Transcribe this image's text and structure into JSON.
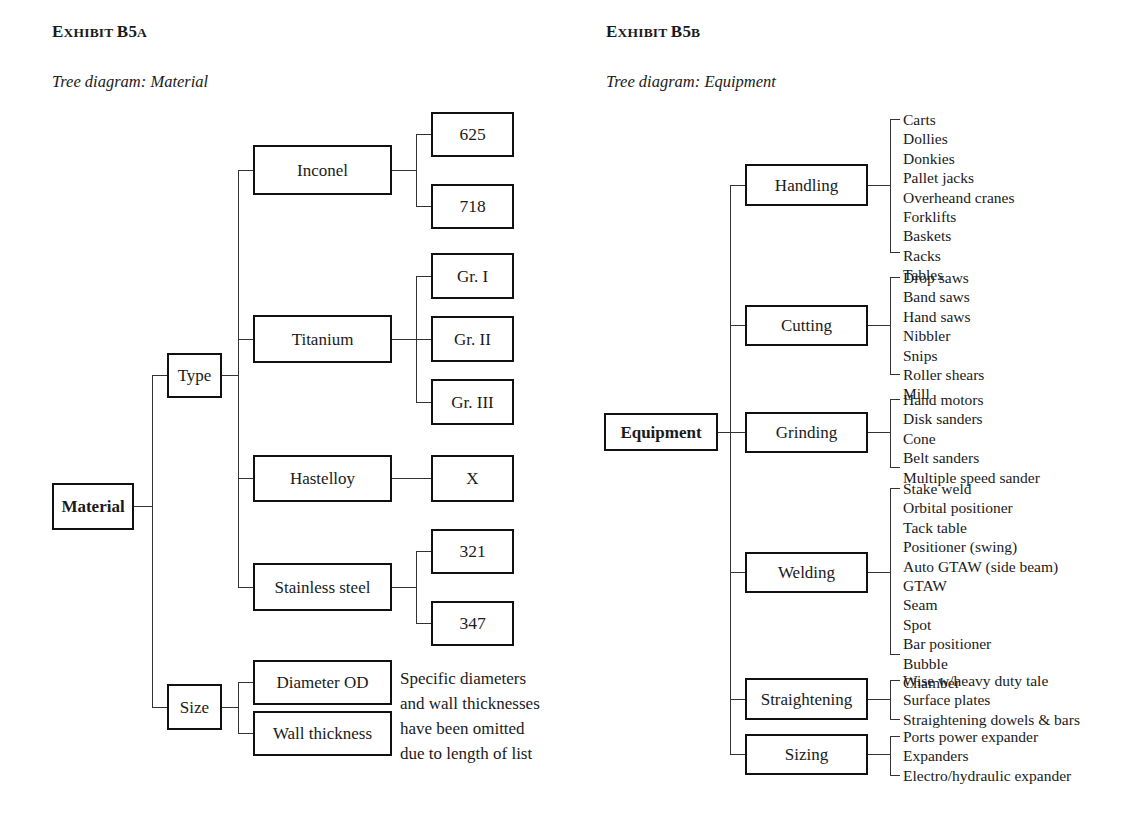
{
  "exhibits": {
    "left": {
      "label_main": "E",
      "title_rest": "XHIBIT",
      "title_full_lead": "E",
      "title": "XHIBIT ",
      "number_big": "B5",
      "number_small": "A",
      "subtitle": "Tree diagram: Material",
      "root": "Material",
      "branches": {
        "type": "Type",
        "size": "Size"
      },
      "type_children": [
        {
          "label": "Inconel",
          "grades": [
            "625",
            "718"
          ]
        },
        {
          "label": "Titanium",
          "grades": [
            "Gr. I",
            "Gr. II",
            "Gr. III"
          ]
        },
        {
          "label": "Hastelloy",
          "grades": [
            "X"
          ]
        },
        {
          "label": "Stainless steel",
          "grades": [
            "321",
            "347"
          ]
        }
      ],
      "size_children": [
        "Diameter OD",
        "Wall thickness"
      ],
      "note": "Specific diameters\nand wall thicknesses\nhave been omitted\ndue to length of list"
    },
    "right": {
      "title": "XHIBIT ",
      "number_big": "B5",
      "number_small": "B",
      "subtitle": "Tree diagram: Equipment",
      "root": "Equipment",
      "categories": [
        {
          "label": "Handling",
          "items": [
            "Carts",
            "Dollies",
            "Donkies",
            "Pallet jacks",
            "Overheand cranes",
            "Forklifts",
            "Baskets",
            "Racks",
            "Tables"
          ]
        },
        {
          "label": "Cutting",
          "items": [
            "Drop saws",
            "Band saws",
            "Hand saws",
            "Nibbler",
            "Snips",
            "Roller shears",
            "Mill"
          ]
        },
        {
          "label": "Grinding",
          "items": [
            "Hand motors",
            "Disk sanders",
            "Cone",
            "Belt sanders",
            "Multiple speed sander"
          ]
        },
        {
          "label": "Welding",
          "items": [
            "Stake weld",
            "Orbital positioner",
            "Tack table",
            "Positioner (swing)",
            "Auto GTAW (side beam)",
            "GTAW",
            "Seam",
            "Spot",
            "Bar positioner",
            "Bubble",
            "Chamber"
          ]
        },
        {
          "label": "Straightening",
          "items": [
            "Wise w/heavy duty tale",
            "Surface plates",
            "Straightening dowels & bars"
          ]
        },
        {
          "label": "Sizing",
          "items": [
            "Ports power expander",
            "Expanders",
            "Electro/hydraulic expander"
          ]
        }
      ]
    }
  },
  "colors": {
    "ink": "#111111",
    "line": "#333333",
    "paper": "#ffffff"
  }
}
